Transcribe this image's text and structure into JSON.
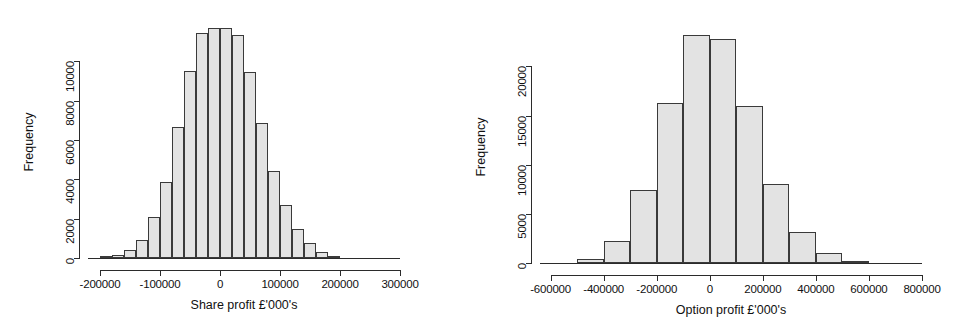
{
  "figure": {
    "background": "#ffffff",
    "bar_fill": "#e3e3e3",
    "bar_stroke": "#3a3a3a",
    "axis_color": "#2b2b2b"
  },
  "chart_data": [
    {
      "type": "bar",
      "id": "share-profit-histogram",
      "title": "",
      "xlabel": "Share profit £'000's",
      "ylabel": "Frequency",
      "xlim": [
        -220000,
        300000
      ],
      "ylim": [
        0,
        11800
      ],
      "grid": false,
      "legend": null,
      "xticks": [
        -200000,
        -100000,
        0,
        100000,
        200000,
        300000
      ],
      "xticklabels": [
        "-200000",
        "-100000",
        "0",
        "100000",
        "200000",
        "300000"
      ],
      "yticks": [
        0,
        2000,
        4000,
        6000,
        8000,
        10000
      ],
      "yticklabels": [
        "0",
        "2000",
        "4000",
        "6000",
        "8000",
        "10000"
      ],
      "bin_width": 20000,
      "bin_starts": [
        -200000,
        -180000,
        -160000,
        -140000,
        -120000,
        -100000,
        -80000,
        -60000,
        -40000,
        -20000,
        0,
        20000,
        40000,
        60000,
        80000,
        100000,
        120000,
        140000,
        160000,
        180000
      ],
      "bin_labels": [
        "-200000 to -180000",
        "-180000 to -160000",
        "-160000 to -140000",
        "-140000 to -120000",
        "-120000 to -100000",
        "-100000 to -80000",
        "-80000 to -60000",
        "-60000 to -40000",
        "-40000 to -20000",
        "-20000 to 0",
        "0 to 20000",
        "20000 to 40000",
        "40000 to 60000",
        "60000 to 80000",
        "80000 to 100000",
        "100000 to 120000",
        "120000 to 140000",
        "140000 to 160000",
        "160000 to 180000",
        "180000 to 200000"
      ],
      "values": [
        60,
        170,
        420,
        900,
        2100,
        3850,
        6650,
        9500,
        11450,
        11700,
        11700,
        11350,
        9450,
        6850,
        4450,
        2700,
        1500,
        750,
        330,
        110
      ]
    },
    {
      "type": "bar",
      "id": "option-profit-histogram",
      "title": "",
      "xlabel": "Option profit £'000's",
      "ylabel": "Frequency",
      "xlim": [
        -640000,
        800000
      ],
      "ylim": [
        0,
        23600
      ],
      "grid": false,
      "legend": null,
      "xticks": [
        -600000,
        -400000,
        -200000,
        0,
        200000,
        400000,
        600000,
        800000
      ],
      "xticklabels": [
        "-600000",
        "-400000",
        "-200000",
        "0",
        "200000",
        "400000",
        "600000",
        "800000"
      ],
      "yticks": [
        0,
        5000,
        10000,
        15000,
        20000
      ],
      "yticklabels": [
        "0",
        "5000",
        "10000",
        "15000",
        "20000"
      ],
      "bin_width": 100000,
      "bin_starts": [
        -500000,
        -400000,
        -300000,
        -200000,
        -100000,
        0,
        100000,
        200000,
        300000,
        400000,
        500000
      ],
      "bin_labels": [
        "-500000 to -400000",
        "-400000 to -300000",
        "-300000 to -200000",
        "-200000 to -100000",
        "-100000 to 0",
        "0 to 100000",
        "100000 to 200000",
        "200000 to 300000",
        "300000 to 400000",
        "400000 to 500000",
        "500000 to 600000"
      ],
      "values": [
        450,
        2250,
        7450,
        16300,
        23150,
        22800,
        15950,
        8050,
        3200,
        1050,
        200
      ]
    }
  ]
}
